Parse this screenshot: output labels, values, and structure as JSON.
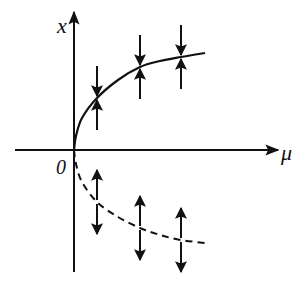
{
  "diagram": {
    "colors": {
      "ink": "#111111",
      "background": "#ffffff"
    },
    "axes": {
      "vertical_label": "x",
      "horizontal_label": "μ",
      "origin_label": "0"
    },
    "branches": [
      {
        "name": "stable-branch",
        "style": "solid",
        "points": [
          [
            74,
            150
          ],
          [
            76,
            136
          ],
          [
            82,
            118
          ],
          [
            97,
            98
          ],
          [
            118,
            80
          ],
          [
            140,
            67
          ],
          [
            160,
            61
          ],
          [
            181,
            57
          ],
          [
            205,
            53
          ]
        ]
      },
      {
        "name": "unstable-branch",
        "style": "dashed",
        "points": [
          [
            74,
            150
          ],
          [
            76,
            164
          ],
          [
            82,
            182
          ],
          [
            97,
            202
          ],
          [
            118,
            217
          ],
          [
            140,
            228
          ],
          [
            160,
            235
          ],
          [
            181,
            240
          ],
          [
            205,
            243
          ]
        ]
      }
    ],
    "flow_arrows": [
      {
        "x": 97,
        "curve_y": 98,
        "branch": "stable",
        "direction": "toward"
      },
      {
        "x": 140,
        "curve_y": 67,
        "branch": "stable",
        "direction": "toward"
      },
      {
        "x": 181,
        "curve_y": 57,
        "branch": "stable",
        "direction": "toward"
      },
      {
        "x": 97,
        "curve_y": 202,
        "branch": "unstable",
        "direction": "away"
      },
      {
        "x": 140,
        "curve_y": 228,
        "branch": "unstable",
        "direction": "away"
      },
      {
        "x": 181,
        "curve_y": 240,
        "branch": "unstable",
        "direction": "away"
      }
    ]
  }
}
